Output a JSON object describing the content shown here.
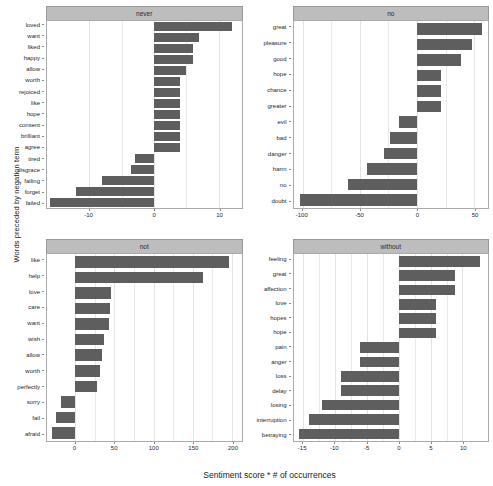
{
  "chart_data": {
    "type": "bar",
    "title": "",
    "xlabel": "Sentiment score * # of occurrences",
    "ylabel": "Words preceded by negation term",
    "orientation": "horizontal",
    "grid": true,
    "legend": false,
    "bar_color": "#5e5e5e",
    "strip_color": "#bdbdbd",
    "facets": [
      {
        "name": "never",
        "label": "never",
        "xlim": [
          -16.5,
          13.5
        ],
        "xticks": [
          -10,
          0,
          10
        ],
        "xtick_labels": [
          "-10",
          "0",
          "10"
        ],
        "categories": [
          "loved",
          "want",
          "liked",
          "happy",
          "allow",
          "worth",
          "rejoiced",
          "like",
          "hope",
          "consent",
          "brilliant",
          "agree",
          "tired",
          "disgrace",
          "failing",
          "forget",
          "failed"
        ],
        "values": [
          12,
          7,
          6,
          6,
          5,
          4,
          4,
          4,
          4,
          4,
          4,
          4,
          -3,
          -3.5,
          -8,
          -12,
          -16
        ]
      },
      {
        "name": "no",
        "label": "no",
        "xlim": [
          -108,
          62
        ],
        "xticks": [
          -100,
          -50,
          0,
          50
        ],
        "xtick_labels": [
          "-100",
          "-50",
          "0",
          "50"
        ],
        "categories": [
          "great",
          "pleasure",
          "good",
          "hope",
          "chance",
          "greater",
          "evil",
          "bad",
          "danger",
          "harm",
          "no",
          "doubt"
        ],
        "values": [
          57,
          48,
          38,
          21,
          21,
          21,
          -16,
          -24,
          -29,
          -44,
          -60,
          -102
        ]
      },
      {
        "name": "not",
        "label": "not",
        "xlim": [
          -36,
          212
        ],
        "xticks": [
          0,
          50,
          100,
          150,
          200
        ],
        "xtick_labels": [
          "0",
          "50",
          "100",
          "150",
          "200"
        ],
        "categories": [
          "like",
          "help",
          "love",
          "care",
          "want",
          "wish",
          "allow",
          "worth",
          "perfectly",
          "sorry",
          "fail",
          "afraid"
        ],
        "values": [
          196,
          163,
          46,
          44,
          43,
          37,
          34,
          32,
          28,
          -18,
          -24,
          -30
        ]
      },
      {
        "name": "without",
        "label": "without",
        "xlim": [
          -16.5,
          14
        ],
        "xticks": [
          -15,
          -10,
          -5,
          0,
          5,
          10
        ],
        "xtick_labels": [
          "-15",
          "-10",
          "-5",
          "0",
          "5",
          "10"
        ],
        "categories": [
          "feeling",
          "great",
          "affection",
          "love",
          "hopes",
          "hope",
          "pain",
          "anger",
          "loss",
          "delay",
          "losing",
          "interruption",
          "betraying"
        ],
        "values": [
          12.8,
          8.8,
          8.8,
          5.9,
          5.9,
          5.9,
          -6,
          -6,
          -9,
          -9,
          -12,
          -14,
          -15.6
        ]
      }
    ]
  }
}
